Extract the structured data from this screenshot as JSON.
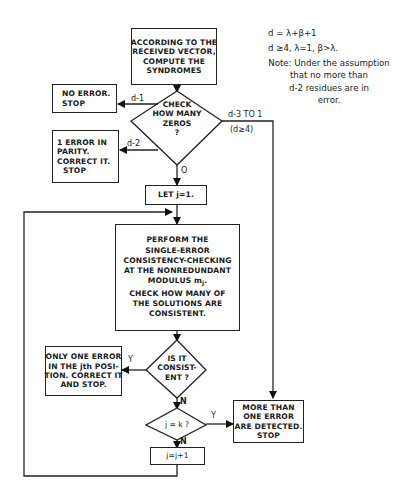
{
  "flowchart": {
    "start_box": {
      "lines": [
        "ACCORDING TO THE",
        "RECEIVED VECTOR,",
        "COMPUTE THE",
        "SYNDROMES"
      ]
    },
    "check_zeros_decision": {
      "lines": [
        "CHECK",
        "HOW MANY",
        "ZEROS",
        "?"
      ]
    },
    "no_error_box": {
      "lines": [
        "NO ERROR.",
        "STOP"
      ]
    },
    "parity_error_box": {
      "lines": [
        "1  ERROR IN",
        "PARITY.",
        "CORRECT IT.",
        "STOP"
      ]
    },
    "let_j_box": {
      "text": "LET j=1."
    },
    "consistency_box": {
      "lines": [
        "PERFORM THE",
        "SINGLE-ERROR",
        "CONSISTENCY-CHECKING",
        "AT THE NONREDUNDANT"
      ],
      "modulus_label": "MODULUS m",
      "modulus_sub": "j",
      "lines2": [
        "CHECK HOW MANY OF",
        "THE SOLUTIONS ARE",
        "CONSISTENT."
      ]
    },
    "is_consistent_decision": {
      "lines": [
        "IS IT",
        "CONSIST-",
        "ENT ?"
      ]
    },
    "one_error_box": {
      "lines": [
        "ONLY ONE ERROR",
        "IN THE jth POSI-",
        "TION. CORRECT IT",
        "AND STOP."
      ]
    },
    "j_eq_k_decision": {
      "text": "j = k  ?"
    },
    "increment_box": {
      "text": "j=j+1"
    },
    "multi_error_box": {
      "lines": [
        "MORE THAN",
        "ONE ERROR",
        "ARE DETECTED.",
        "STOP"
      ]
    },
    "edge_labels": {
      "d_minus_1": "d-1",
      "d_minus_2": "d-2",
      "d_minus_3_to_1": "d-3  TO  1",
      "d_ge_4": "(d≥4)",
      "zero": "O",
      "consistent_yes": "Y",
      "consistent_no": "N",
      "jk_yes": "Y",
      "jk_no": "N"
    }
  },
  "notes": {
    "formula1": "d = λ+β+1",
    "formula2": "d ≥4, λ=1,  β>λ.",
    "note_lines": [
      "Note: Under the assumption",
      "that no more than",
      "d-2 residues are in",
      "error."
    ]
  }
}
